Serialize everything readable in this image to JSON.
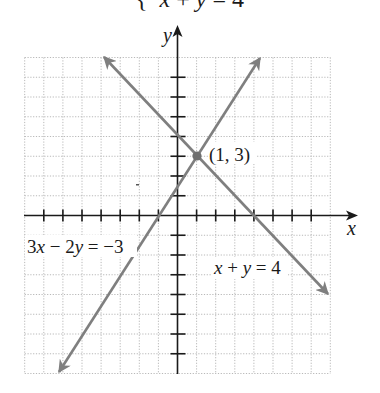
{
  "title": {
    "brace": "{",
    "var_x": "x",
    "plus": " + ",
    "var_y": "y",
    "rest": " = 4"
  },
  "axes": {
    "x_label": "x",
    "y_label": "y",
    "x_range": [
      -8,
      8
    ],
    "y_range": [
      -8,
      8
    ],
    "tick_step": 1
  },
  "labels": {
    "point": "(1, 3)",
    "line1": {
      "lhs_a": "3",
      "var1": "x",
      "op": " − 2",
      "var2": "y",
      "rhs": " = −3"
    },
    "line2": {
      "var1": "x",
      "op": " + ",
      "var2": "y",
      "rhs": " = 4"
    }
  },
  "colors": {
    "line": "#7f7f7f",
    "axis": "#1a1a1a",
    "grid": "#b8b8b8",
    "point": "#6e6e6e"
  },
  "chart_data": {
    "type": "line",
    "xlabel": "x",
    "ylabel": "y",
    "xlim": [
      -8,
      8
    ],
    "ylim": [
      -8,
      8
    ],
    "grid": true,
    "series": [
      {
        "name": "x + y = 4",
        "x": [
          -3.85,
          7.9
        ],
        "y": [
          7.85,
          -3.9
        ]
      },
      {
        "name": "3x − 2y = −3",
        "x": [
          -6.2,
          4.3
        ],
        "y": [
          -7.8,
          7.95
        ]
      }
    ],
    "annotations": [
      {
        "text": "(1, 3)",
        "x": 1,
        "y": 3,
        "marker": "point"
      },
      {
        "text": "3x − 2y = −3",
        "x": -7.8,
        "y": -1.8
      },
      {
        "text": "x + y = 4",
        "x": 2,
        "y": -3
      }
    ]
  }
}
